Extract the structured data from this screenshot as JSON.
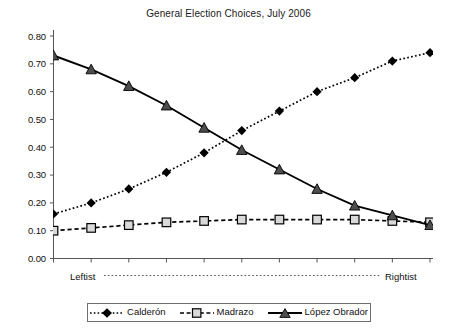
{
  "chart_data": {
    "type": "line",
    "title": "General Election Choices, July 2006",
    "xlabel": "",
    "ylabel": "",
    "ylim": [
      0.0,
      0.8
    ],
    "ytick_labels": [
      "0.80",
      "0.70",
      "0.60",
      "0.50",
      "0.40",
      "0.30",
      "0.20",
      "0.10",
      "0.00"
    ],
    "ytick_values": [
      0.8,
      0.7,
      0.6,
      0.5,
      0.4,
      0.3,
      0.2,
      0.1,
      0.0
    ],
    "grid": false,
    "legend_position": "bottom",
    "x_axis_left_label": "Leftist",
    "x_axis_right_label": "Rightist",
    "x_axis_connector": "dotted",
    "n_points": 11,
    "x": [
      1,
      2,
      3,
      4,
      5,
      6,
      7,
      8,
      9,
      10,
      11
    ],
    "categories": [
      "1",
      "2",
      "3",
      "4",
      "5",
      "6",
      "7",
      "8",
      "9",
      "10",
      "11"
    ],
    "series": [
      {
        "name": "Calderón",
        "marker": "filled-diamond",
        "line_style": "dotted",
        "color": "#000000",
        "values": [
          0.16,
          0.2,
          0.25,
          0.31,
          0.38,
          0.46,
          0.53,
          0.6,
          0.65,
          0.71,
          0.74
        ]
      },
      {
        "name": "Madrazo",
        "marker": "open-square",
        "line_style": "dashed",
        "color": "#000000",
        "marker_fill": "#d9d9d9",
        "values": [
          0.1,
          0.11,
          0.12,
          0.13,
          0.135,
          0.14,
          0.14,
          0.14,
          0.14,
          0.135,
          0.13
        ]
      },
      {
        "name": "López Obrador",
        "marker": "filled-triangle",
        "line_style": "solid",
        "color": "#000000",
        "marker_fill": "#4d4d4d",
        "values": [
          0.73,
          0.68,
          0.62,
          0.55,
          0.47,
          0.39,
          0.32,
          0.25,
          0.19,
          0.155,
          0.12
        ]
      }
    ]
  },
  "legend": {
    "entries": [
      {
        "label": "Calderón"
      },
      {
        "label": "Madrazo"
      },
      {
        "label": "López Obrador"
      }
    ]
  }
}
